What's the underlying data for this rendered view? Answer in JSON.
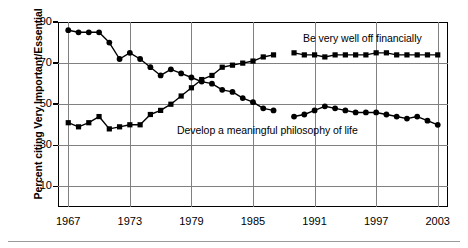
{
  "chart_data": {
    "type": "line",
    "title": "",
    "xlabel": "",
    "ylabel": "Percent citing Very Important/Essential",
    "xlim": [
      1966,
      2004
    ],
    "ylim": [
      0,
      90
    ],
    "grid": true,
    "legend_position": "inline-annotations",
    "y_ticks": [
      10,
      30,
      50,
      70,
      90
    ],
    "x_ticks": [
      1967,
      1973,
      1979,
      1985,
      1991,
      1997,
      2003
    ],
    "series": [
      {
        "name": "Be very well off financially",
        "marker": "square",
        "color": "#000000",
        "annotation": "Be very well off financially",
        "x": [
          1967,
          1968,
          1969,
          1970,
          1971,
          1972,
          1973,
          1974,
          1975,
          1976,
          1977,
          1978,
          1979,
          1980,
          1981,
          1982,
          1983,
          1984,
          1985,
          1986,
          1987,
          1989,
          1990,
          1991,
          1992,
          1993,
          1994,
          1995,
          1996,
          1997,
          1998,
          1999,
          2000,
          2001,
          2002,
          2003
        ],
        "values": [
          41,
          39,
          41,
          44,
          38,
          39,
          40,
          40,
          45,
          47,
          50,
          54,
          58,
          62,
          64,
          68,
          69,
          70,
          71,
          73,
          74,
          75,
          74,
          74,
          73,
          74,
          74,
          74,
          74,
          75,
          75,
          74,
          74,
          74,
          74,
          74
        ]
      },
      {
        "name": "Develop a meaningful philosophy of life",
        "marker": "circle",
        "color": "#000000",
        "annotation": "Develop a meaningful philosophy of life",
        "x": [
          1967,
          1968,
          1969,
          1970,
          1971,
          1972,
          1973,
          1974,
          1975,
          1976,
          1977,
          1978,
          1979,
          1980,
          1981,
          1982,
          1983,
          1984,
          1985,
          1986,
          1987,
          1989,
          1990,
          1991,
          1992,
          1993,
          1994,
          1995,
          1996,
          1997,
          1998,
          1999,
          2000,
          2001,
          2002,
          2003
        ],
        "values": [
          86,
          85,
          85,
          85,
          80,
          72,
          75,
          72,
          68,
          64,
          67,
          65,
          63,
          61,
          60,
          57,
          56,
          53,
          51,
          48,
          47,
          44,
          45,
          47,
          49,
          48,
          47,
          46,
          46,
          46,
          45,
          44,
          43,
          44,
          42,
          40
        ]
      }
    ]
  },
  "axis": {
    "y_title": "Percent citing Very Important/Essential",
    "y_tick_labels": [
      "90",
      "70",
      "50",
      "30",
      "10"
    ],
    "x_tick_labels": [
      "1967",
      "1973",
      "1979",
      "1985",
      "1991",
      "1997",
      "2003"
    ]
  },
  "annotations": {
    "top_series_label": "Be very well off financially",
    "bottom_series_label": "Develop a meaningful philosophy of life"
  },
  "colors": {
    "axis": "#000000",
    "grid": "#808080",
    "series": "#000000",
    "background": "#ffffff",
    "rule": "#9a9a9a"
  }
}
